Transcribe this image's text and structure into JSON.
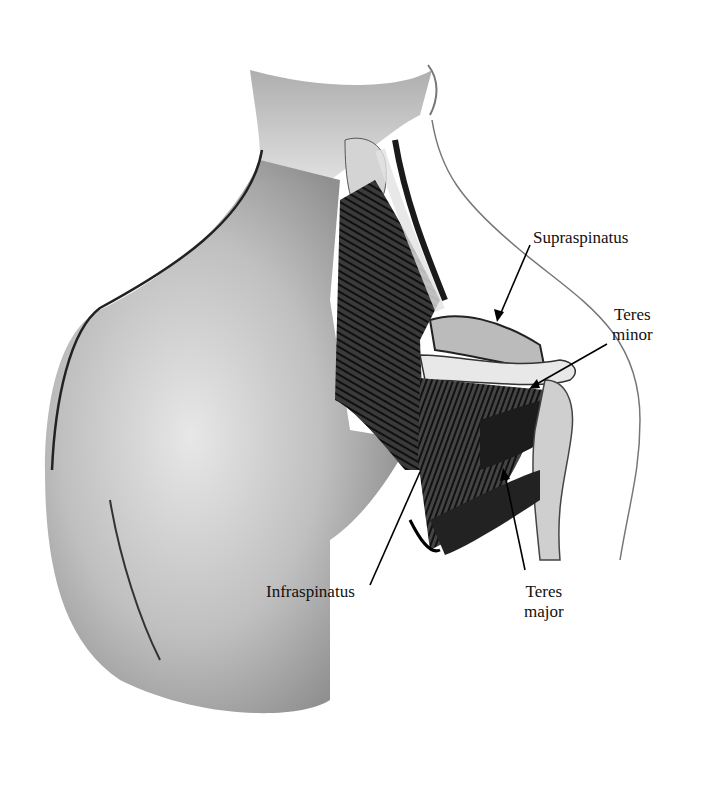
{
  "figure": {
    "labels": {
      "supraspinatus": "Supraspinatus",
      "teres_minor_line1": "Teres",
      "teres_minor_line2": "minor",
      "infraspinatus": "Infraspinatus",
      "teres_major_line1": "Teres",
      "teres_major_line2": "major"
    }
  },
  "colors": {
    "background": "#ffffff",
    "ink": "#111111",
    "skin_shade": "#bdbdbd",
    "muscle": "#2a2a2a"
  }
}
